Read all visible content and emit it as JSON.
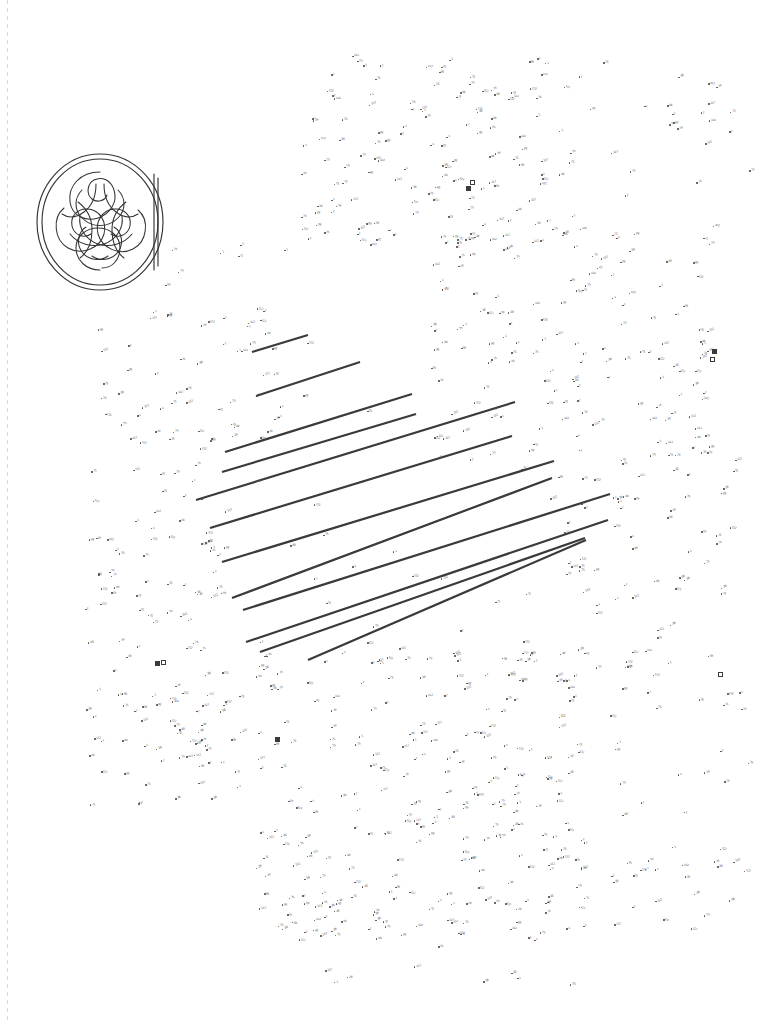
{
  "page": {
    "kind": "connect-the-dots-puzzle-page",
    "background_color": "#ffffff",
    "ink_color": "#4a4a4a",
    "line_color": "#3a3a3a",
    "width": 760,
    "height": 1024
  },
  "binding_edge": {
    "name": "dashed-margin-rule",
    "x": 7,
    "color": "#d8d8d8"
  },
  "medallion": {
    "title": "Celtic knot medallion",
    "style": "interlaced triquetra knotwork in double ring",
    "x": 34,
    "y": 148,
    "width": 136,
    "height": 148,
    "stroke_color": "#333333"
  },
  "stripes": {
    "label": "diagonal guide stripes",
    "color": "#3a3a3a",
    "width_px": 2.2,
    "lines": [
      {
        "x1": 252,
        "y1": 352,
        "x2": 308,
        "y2": 335
      },
      {
        "x1": 256,
        "y1": 396,
        "x2": 360,
        "y2": 362
      },
      {
        "x1": 225,
        "y1": 452,
        "x2": 412,
        "y2": 394
      },
      {
        "x1": 222,
        "y1": 472,
        "x2": 416,
        "y2": 414
      },
      {
        "x1": 196,
        "y1": 500,
        "x2": 515,
        "y2": 402
      },
      {
        "x1": 210,
        "y1": 528,
        "x2": 512,
        "y2": 436
      },
      {
        "x1": 222,
        "y1": 562,
        "x2": 554,
        "y2": 461
      },
      {
        "x1": 232,
        "y1": 598,
        "x2": 552,
        "y2": 478
      },
      {
        "x1": 243,
        "y1": 610,
        "x2": 610,
        "y2": 494
      },
      {
        "x1": 246,
        "y1": 642,
        "x2": 608,
        "y2": 520
      },
      {
        "x1": 260,
        "y1": 652,
        "x2": 585,
        "y2": 538
      },
      {
        "x1": 308,
        "y1": 660,
        "x2": 586,
        "y2": 540
      }
    ]
  },
  "square_markers": [
    {
      "x": 470,
      "y": 180,
      "filled": false
    },
    {
      "x": 466,
      "y": 186,
      "filled": true
    },
    {
      "x": 712,
      "y": 349,
      "filled": true
    },
    {
      "x": 710,
      "y": 357,
      "filled": false
    },
    {
      "x": 718,
      "y": 672,
      "filled": false
    },
    {
      "x": 275,
      "y": 737,
      "filled": true
    },
    {
      "x": 155,
      "y": 661,
      "filled": true
    },
    {
      "x": 161,
      "y": 660,
      "filled": false
    }
  ],
  "dot_field": {
    "description": "hundreds of small numbered dots forming the hidden picture",
    "approx_count": 940,
    "number_range": [
      1,
      148
    ],
    "label_color": "#5a5a5a",
    "dot_color": "#4a4a4a",
    "regions": [
      {
        "name": "upper-dense-cluster",
        "x": 300,
        "y": 55,
        "w": 260,
        "h": 190,
        "density": 0.95
      },
      {
        "name": "upper-right-sparse",
        "x": 560,
        "y": 60,
        "w": 200,
        "h": 200,
        "density": 0.28
      },
      {
        "name": "mid-left-band",
        "x": 95,
        "y": 240,
        "w": 190,
        "h": 200,
        "density": 0.6
      },
      {
        "name": "mid-right-band",
        "x": 430,
        "y": 230,
        "w": 280,
        "h": 230,
        "density": 0.7
      },
      {
        "name": "striped-interior",
        "x": 200,
        "y": 340,
        "w": 400,
        "h": 320,
        "density": 0.08
      },
      {
        "name": "left-column",
        "x": 85,
        "y": 430,
        "w": 140,
        "h": 340,
        "density": 0.72
      },
      {
        "name": "right-column",
        "x": 560,
        "y": 440,
        "w": 180,
        "h": 260,
        "density": 0.55
      },
      {
        "name": "lower-dense-cluster",
        "x": 255,
        "y": 640,
        "w": 330,
        "h": 300,
        "density": 0.96
      },
      {
        "name": "lower-left-tail",
        "x": 85,
        "y": 690,
        "w": 160,
        "h": 120,
        "density": 0.55
      },
      {
        "name": "lower-right-tail",
        "x": 600,
        "y": 700,
        "w": 150,
        "h": 230,
        "density": 0.38
      },
      {
        "name": "bottom-fringe",
        "x": 320,
        "y": 930,
        "w": 280,
        "h": 55,
        "density": 0.2
      }
    ]
  }
}
